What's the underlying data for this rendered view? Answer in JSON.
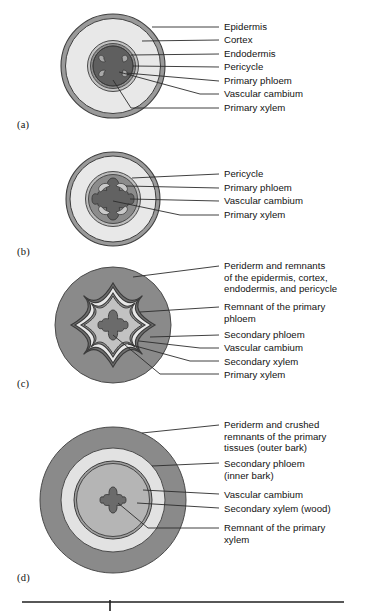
{
  "figure": {
    "panels": [
      {
        "tag": "(a)",
        "stage": "primary growth",
        "labels": [
          {
            "text": "Epidermis"
          },
          {
            "text": "Cortex"
          },
          {
            "text": "Endodermis"
          },
          {
            "text": "Pericycle"
          },
          {
            "text": "Primary phloem"
          },
          {
            "text": "Vascular cambium"
          },
          {
            "text": "Primary xylem"
          }
        ]
      },
      {
        "tag": "(b)",
        "stage": "early secondary growth",
        "labels": [
          {
            "text": "Pericycle"
          },
          {
            "text": "Primary phloem"
          },
          {
            "text": "Vascular cambium"
          },
          {
            "text": "Primary xylem"
          }
        ]
      },
      {
        "tag": "(c)",
        "stage": "continued secondary growth",
        "labels": [
          {
            "text": "Periderm and remnants\nof the epidermis, cortex,\nendodermis, and pericycle"
          },
          {
            "text": "Remnant of the primary\nphloem"
          },
          {
            "text": "Secondary phloem"
          },
          {
            "text": "Vascular cambium"
          },
          {
            "text": "Secondary xylem"
          },
          {
            "text": "Primary xylem"
          }
        ]
      },
      {
        "tag": "(d)",
        "stage": "extensive secondary growth",
        "labels": [
          {
            "text": "Periderm and crushed\nremnants of the primary\ntissues (outer bark)"
          },
          {
            "text": "Secondary phloem\n(inner bark)"
          },
          {
            "text": "Vascular cambium"
          },
          {
            "text": "Secondary xylem (wood)"
          },
          {
            "text": "Remnant of the primary\nxylem"
          }
        ]
      }
    ],
    "colors": {
      "white": "#ffffff",
      "very_light": "#e8e8e8",
      "light": "#e2e2e2",
      "medium_light": "#c9c9c9",
      "medium": "#b5b5b5",
      "dark": "#8a8a8a",
      "darker": "#6f6f6f",
      "outline": "#3b3b3b",
      "leader": "#2b2b2b",
      "rule": "#1f1f1f"
    }
  }
}
